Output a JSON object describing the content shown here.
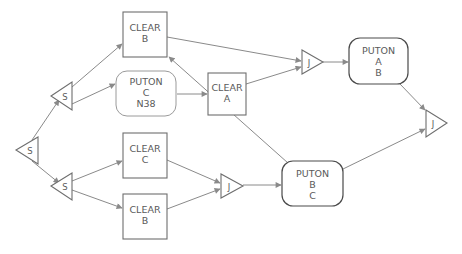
{
  "diagram": {
    "type": "plan-network",
    "colors": {
      "line": "#8a8a8a",
      "shape_stroke": "#6e6e6e",
      "text": "#5a5a5a",
      "background": "#ffffff"
    },
    "nodes": {
      "split_root": {
        "kind": "split",
        "label": "S"
      },
      "split_top": {
        "kind": "split",
        "label": "S"
      },
      "split_bottom": {
        "kind": "split",
        "label": "S"
      },
      "clear_b_top": {
        "kind": "action",
        "lines": [
          "CLEAR",
          "B"
        ]
      },
      "puton_c_n38": {
        "kind": "goal",
        "lines": [
          "PUTON",
          "C",
          "N38"
        ]
      },
      "clear_a": {
        "kind": "action",
        "lines": [
          "CLEAR",
          "A"
        ]
      },
      "join_top": {
        "kind": "join",
        "label": "J"
      },
      "puton_a_b": {
        "kind": "goal",
        "lines": [
          "PUTON",
          "A",
          "B"
        ]
      },
      "join_final": {
        "kind": "join",
        "label": "J"
      },
      "clear_c": {
        "kind": "action",
        "lines": [
          "CLEAR",
          "C"
        ]
      },
      "clear_b_bottom": {
        "kind": "action",
        "lines": [
          "CLEAR",
          "B"
        ]
      },
      "join_bottom": {
        "kind": "join",
        "label": "J"
      },
      "puton_b_c": {
        "kind": "goal",
        "lines": [
          "PUTON",
          "B",
          "C"
        ]
      }
    },
    "edges": [
      {
        "from": "split_root",
        "to": "split_top"
      },
      {
        "from": "split_root",
        "to": "split_bottom"
      },
      {
        "from": "split_top",
        "to": "clear_b_top"
      },
      {
        "from": "split_top",
        "to": "puton_c_n38"
      },
      {
        "from": "puton_c_n38",
        "to": "clear_a"
      },
      {
        "from": "clear_b_top",
        "to": "join_top"
      },
      {
        "from": "clear_a",
        "to": "join_top"
      },
      {
        "from": "join_top",
        "to": "puton_a_b"
      },
      {
        "from": "puton_a_b",
        "to": "join_final"
      },
      {
        "from": "split_bottom",
        "to": "clear_c"
      },
      {
        "from": "split_bottom",
        "to": "clear_b_bottom"
      },
      {
        "from": "clear_c",
        "to": "join_bottom"
      },
      {
        "from": "clear_b_bottom",
        "to": "join_bottom"
      },
      {
        "from": "join_bottom",
        "to": "puton_b_c"
      },
      {
        "from": "puton_b_c",
        "to": "clear_b_top"
      },
      {
        "from": "puton_b_c",
        "to": "join_final"
      }
    ]
  }
}
